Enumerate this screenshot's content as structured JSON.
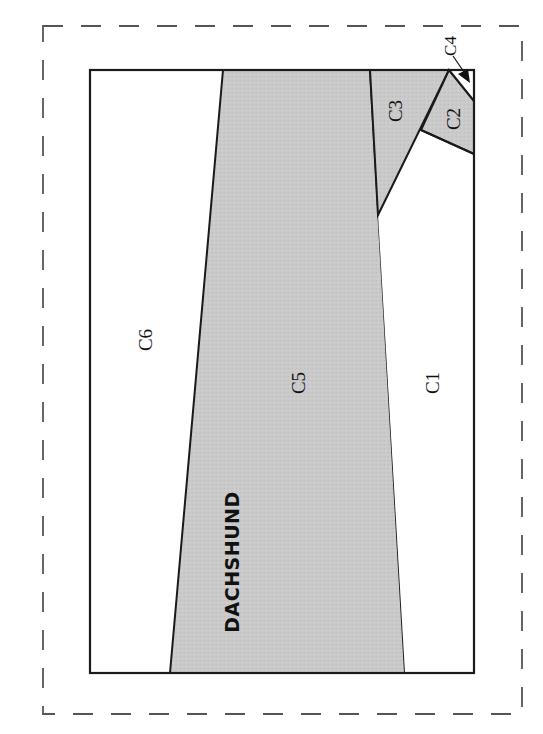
{
  "diagram": {
    "type": "cutting-layout",
    "colors": {
      "shaded_fill": "#c9c9c9",
      "unshaded_fill": "#ffffff",
      "line": "#1a1a1a",
      "dashed_border": "#555555"
    },
    "regions": [
      {
        "id": "C1",
        "label": "C1",
        "shaded": false
      },
      {
        "id": "C2",
        "label": "C2",
        "shaded": true
      },
      {
        "id": "C3",
        "label": "C3",
        "shaded": true
      },
      {
        "id": "C4",
        "label": "C4",
        "shaded": false
      },
      {
        "id": "C5",
        "label": "C5",
        "shaded": true
      },
      {
        "id": "C6",
        "label": "C6",
        "shaded": false
      }
    ],
    "labels": {
      "c1": "C1",
      "c2": "C2",
      "c3": "C3",
      "c4": "C4",
      "c5": "C5",
      "c6": "C6",
      "breed": "DACHSHUND"
    }
  }
}
